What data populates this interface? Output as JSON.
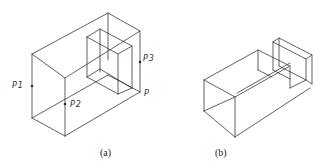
{
  "figures": [
    {
      "id": "a",
      "caption": "(a)",
      "points": [
        {
          "label": "P1"
        },
        {
          "label": "P2"
        },
        {
          "label": "P3"
        },
        {
          "label": "P"
        }
      ]
    },
    {
      "id": "b",
      "caption": "(b)"
    }
  ],
  "colors": {
    "line": "#3a3a3a",
    "background": "#ffffff"
  }
}
